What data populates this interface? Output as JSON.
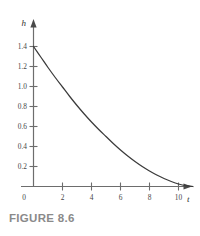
{
  "figure": {
    "caption": "FIGURE 8.6",
    "axis_label_y": "h",
    "axis_label_x": "t",
    "origin_label": "0"
  },
  "chart_data": {
    "type": "line",
    "title": "",
    "subtitle": "",
    "xlabel": "t",
    "ylabel": "h",
    "grid": false,
    "legend": null,
    "xlim": [
      0,
      11.5
    ],
    "ylim": [
      0,
      1.55
    ],
    "xticks": [
      2,
      4,
      6,
      8,
      10
    ],
    "xtick_labels": [
      "2",
      "4",
      "6",
      "8",
      "10"
    ],
    "yticks": [
      0.2,
      0.4,
      0.6,
      0.8,
      1.0,
      1.2,
      1.4
    ],
    "ytick_labels": [
      "0.2",
      "0.4",
      "0.6",
      "0.8",
      "1.0",
      "1.2",
      "1.4"
    ],
    "origin_label": "0",
    "series": [
      {
        "name": "h(t)",
        "x": [
          0,
          0.5,
          1,
          1.5,
          2,
          2.5,
          3,
          3.5,
          4,
          4.5,
          5,
          5.5,
          6,
          6.5,
          7,
          7.5,
          8,
          8.5,
          9,
          9.5,
          10,
          10.5,
          11
        ],
        "y": [
          1.4,
          1.295,
          1.19,
          1.09,
          0.995,
          0.9,
          0.81,
          0.725,
          0.645,
          0.57,
          0.5,
          0.43,
          0.365,
          0.305,
          0.25,
          0.2,
          0.155,
          0.115,
          0.08,
          0.05,
          0.025,
          0.008,
          0.0
        ]
      }
    ]
  },
  "colors": {
    "curve": "#3b3b3b",
    "axis": "#6d6d6d",
    "caption": "#8a8a8a",
    "label": "#464646",
    "background": "#ffffff"
  }
}
